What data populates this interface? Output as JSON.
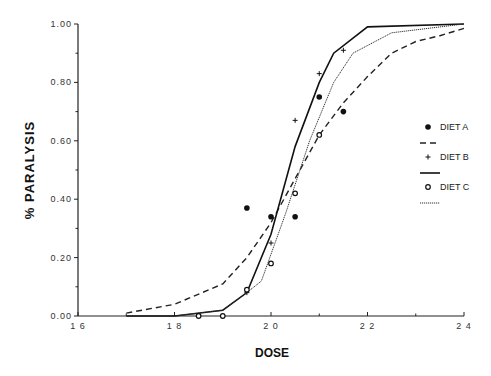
{
  "chart_data": {
    "type": "line",
    "title": "",
    "xlabel": "DOSE",
    "ylabel": "% PARALYSIS",
    "xlim": [
      16,
      24
    ],
    "ylim": [
      0,
      1
    ],
    "x_ticks": [
      "16",
      "18",
      "20",
      "22",
      "24"
    ],
    "y_ticks": [
      "0.00",
      "0.20",
      "0.40",
      "0.60",
      "0.80",
      "1.00"
    ],
    "grid": false,
    "legend_position": "right",
    "legend": [
      {
        "label": "DIET A",
        "marker": "filled-circle",
        "line": "dashed"
      },
      {
        "label": "DIET B",
        "marker": "plus",
        "line": "solid"
      },
      {
        "label": "DIET C",
        "marker": "open-circle",
        "line": "dotted"
      }
    ],
    "series": [
      {
        "name": "DIET A",
        "points": [
          [
            19.5,
            0.37
          ],
          [
            20.0,
            0.34
          ],
          [
            20.5,
            0.34
          ],
          [
            21.0,
            0.75
          ],
          [
            21.5,
            0.7
          ]
        ],
        "fit": [
          [
            17.0,
            0.01
          ],
          [
            18.0,
            0.04
          ],
          [
            19.0,
            0.11
          ],
          [
            19.5,
            0.2
          ],
          [
            20.0,
            0.32
          ],
          [
            20.5,
            0.47
          ],
          [
            21.0,
            0.62
          ],
          [
            21.5,
            0.73
          ],
          [
            22.0,
            0.82
          ],
          [
            22.5,
            0.9
          ],
          [
            23.0,
            0.94
          ],
          [
            23.5,
            0.96
          ],
          [
            24.0,
            0.985
          ]
        ]
      },
      {
        "name": "DIET B",
        "points": [
          [
            19.5,
            0.08
          ],
          [
            20.0,
            0.25
          ],
          [
            20.5,
            0.67
          ],
          [
            21.0,
            0.83
          ],
          [
            21.5,
            0.91
          ]
        ],
        "fit": [
          [
            17.0,
            0.0
          ],
          [
            18.0,
            0.0
          ],
          [
            19.0,
            0.02
          ],
          [
            19.5,
            0.08
          ],
          [
            20.0,
            0.28
          ],
          [
            20.5,
            0.58
          ],
          [
            21.0,
            0.8
          ],
          [
            21.3,
            0.9
          ],
          [
            22.0,
            0.99
          ],
          [
            24.0,
            1.0
          ]
        ]
      },
      {
        "name": "DIET C",
        "points": [
          [
            18.5,
            0.0
          ],
          [
            19.0,
            0.0
          ],
          [
            19.5,
            0.09
          ],
          [
            20.0,
            0.18
          ],
          [
            20.5,
            0.42
          ],
          [
            21.0,
            0.62
          ]
        ],
        "fit": [
          [
            17.0,
            0.0
          ],
          [
            18.0,
            0.0
          ],
          [
            19.0,
            0.02
          ],
          [
            19.5,
            0.08
          ],
          [
            19.8,
            0.12
          ],
          [
            20.3,
            0.35
          ],
          [
            20.8,
            0.6
          ],
          [
            21.3,
            0.8
          ],
          [
            21.7,
            0.9
          ],
          [
            22.5,
            0.97
          ],
          [
            24.0,
            1.0
          ]
        ]
      }
    ]
  }
}
